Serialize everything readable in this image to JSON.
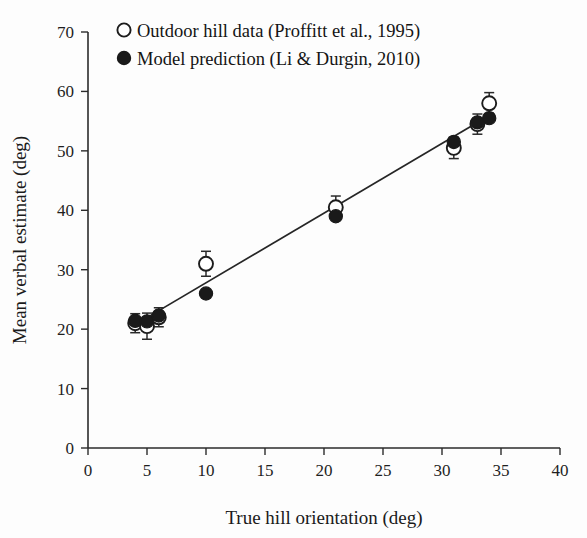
{
  "chart_data": {
    "type": "scatter",
    "title": "",
    "xlabel": "True hill orientation (deg)",
    "ylabel": "Mean verbal estimate (deg)",
    "xlim": [
      0,
      40
    ],
    "ylim": [
      0,
      70
    ],
    "xticks": [
      0,
      5,
      10,
      15,
      20,
      25,
      30,
      35,
      40
    ],
    "xtick_labels": [
      "0",
      "5",
      "10",
      "15",
      "20",
      "25",
      "30",
      "35",
      "40"
    ],
    "yticks": [
      0,
      10,
      20,
      30,
      40,
      50,
      60,
      70
    ],
    "ytick_labels": [
      "0",
      "10",
      "20",
      "30",
      "40",
      "50",
      "60",
      "70"
    ],
    "grid": false,
    "legend_position": "top-left",
    "series": [
      {
        "name": "Outdoor hill data (Proffitt et al., 1995)",
        "marker": "open-circle",
        "color": "#ffffff",
        "edge_color": "#1c1c1c",
        "points": [
          {
            "x": 4,
            "y": 21.0,
            "yerr": 1.6
          },
          {
            "x": 5,
            "y": 20.5,
            "yerr": 2.2
          },
          {
            "x": 6,
            "y": 22.0,
            "yerr": 1.6
          },
          {
            "x": 10,
            "y": 31.0,
            "yerr": 2.1
          },
          {
            "x": 21,
            "y": 40.5,
            "yerr": 1.9
          },
          {
            "x": 31,
            "y": 50.5,
            "yerr": 1.8
          },
          {
            "x": 33,
            "y": 54.5,
            "yerr": 1.7
          },
          {
            "x": 34,
            "y": 58.0,
            "yerr": 1.8
          }
        ]
      },
      {
        "name": "Model prediction (Li & Durgin, 2010)",
        "marker": "filled-circle",
        "color": "#1a1a1a",
        "points": [
          {
            "x": 4,
            "y": 21.4
          },
          {
            "x": 5,
            "y": 21.3
          },
          {
            "x": 6,
            "y": 22.3
          },
          {
            "x": 10,
            "y": 26.0
          },
          {
            "x": 21,
            "y": 39.0
          },
          {
            "x": 31,
            "y": 51.5
          },
          {
            "x": 33,
            "y": 54.8
          },
          {
            "x": 34,
            "y": 55.5
          }
        ]
      }
    ],
    "fit_line": {
      "x_start": 3.6,
      "y_start": 20.3,
      "x_end": 34.4,
      "y_end": 56.4
    }
  },
  "legend": {
    "entries": [
      {
        "label": "Outdoor hill data (Proffitt et al., 1995)",
        "marker": "open-circle"
      },
      {
        "label": "Model prediction (Li & Durgin, 2010)",
        "marker": "filled-circle"
      }
    ]
  },
  "colors": {
    "axis": "#2b2b2b",
    "text": "#1a1a1a",
    "marker_fill": "#1a1a1a",
    "marker_open": "#ffffff",
    "background": "#fdfdfd"
  }
}
